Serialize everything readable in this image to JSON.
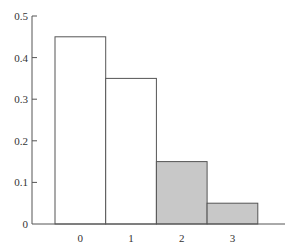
{
  "chart_data": {
    "type": "bar",
    "title": "",
    "xlabel": "",
    "ylabel": "",
    "categories": [
      "0",
      "1",
      "2",
      "3"
    ],
    "values": [
      0.45,
      0.35,
      0.15,
      0.05
    ],
    "highlighted": [
      false,
      false,
      true,
      true
    ],
    "ylim": [
      0,
      0.5
    ],
    "yticks": [
      "0",
      "0.1",
      "0.2",
      "0.3",
      "0.4",
      "0.5"
    ],
    "grid": false,
    "legend": null,
    "colors": {
      "normal_fill": "#ffffff",
      "highlight_fill": "#c8c8c8",
      "stroke": "#555555"
    }
  }
}
